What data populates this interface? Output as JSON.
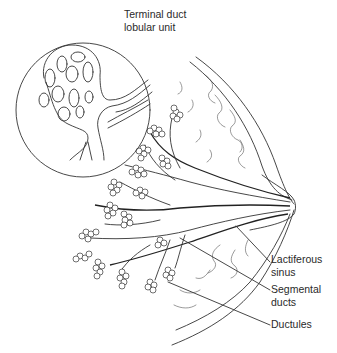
{
  "figure": {
    "type": "anatomical line illustration",
    "colors": {
      "ink": "#333333",
      "background": "#ffffff",
      "text": "#2a2a2a"
    }
  },
  "labels": {
    "tdlu": {
      "line1": "Terminal duct",
      "line2": "lobular unit"
    },
    "lactiferous_sinus": {
      "line1": "Lactiferous",
      "line2": "sinus"
    },
    "segmental_ducts": {
      "line1": "Segmental",
      "line2": "ducts"
    },
    "ductules": {
      "line1": "Ductules"
    }
  },
  "inset": {
    "shape": "circle",
    "depicts": "magnified terminal duct lobular unit"
  }
}
